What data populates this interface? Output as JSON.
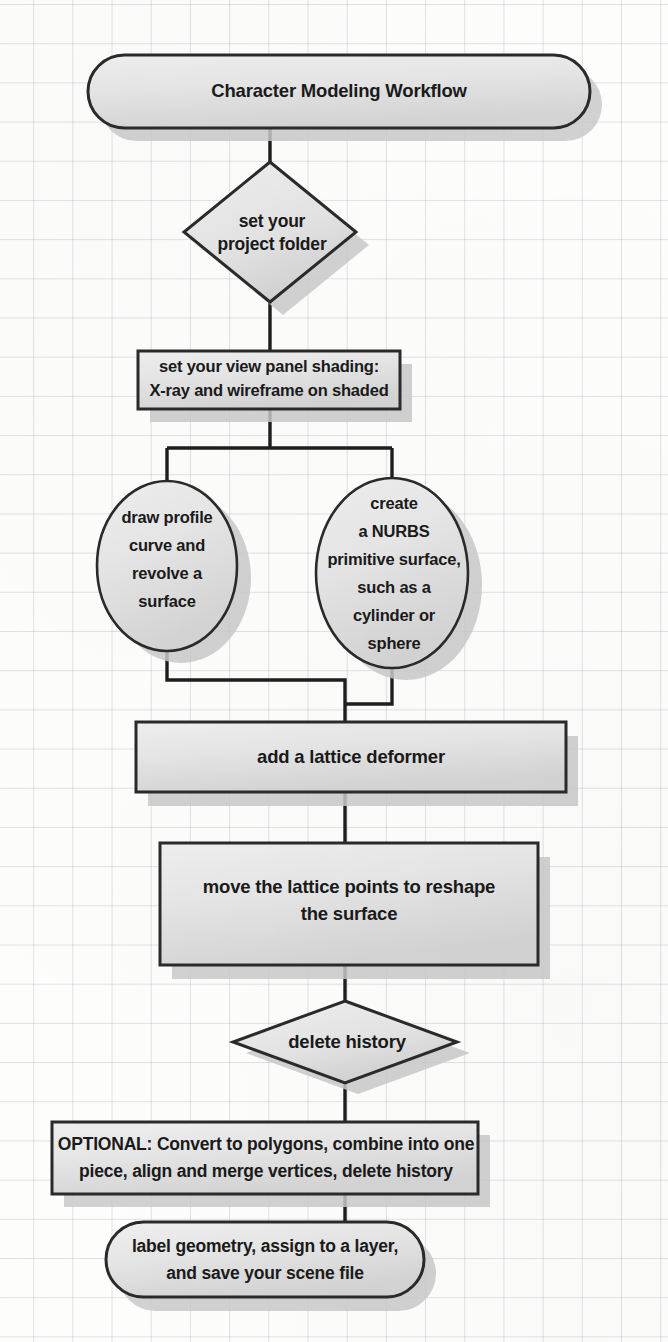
{
  "diagram": {
    "type": "flowchart",
    "title": "Character Modeling Workflow",
    "background": "#fdfdfc",
    "grid_color": "#96a0af",
    "shape_fill_light": "#ececec",
    "shape_fill_dark": "#d6d6d6",
    "shape_stroke": "#2a2a2a",
    "shadow_color": "#c9c9c9",
    "connector_color": "#1e1e1e",
    "nodes": [
      {
        "id": "title",
        "shape": "stadium",
        "label": "Character Modeling Workflow",
        "lines": [
          "Character Modeling Workflow"
        ]
      },
      {
        "id": "set-project-folder",
        "shape": "diamond",
        "label": "set your project folder",
        "lines": [
          "set your",
          "project folder"
        ]
      },
      {
        "id": "view-panel-shading",
        "shape": "rectangle",
        "label": "set your view panel shading: X-ray and wireframe on shaded",
        "lines": [
          "set your view panel shading:",
          "X-ray and wireframe on shaded"
        ]
      },
      {
        "id": "draw-profile-curve",
        "shape": "circle",
        "label": "draw profile curve and revolve a surface",
        "lines": [
          "draw profile",
          "curve and",
          "revolve a",
          "surface"
        ]
      },
      {
        "id": "create-nurbs-primitive",
        "shape": "circle",
        "label": "create a NURBS primitive surface, such as a cylinder or sphere",
        "lines": [
          "create",
          "a NURBS",
          "primitive surface,",
          "such as a",
          "cylinder or",
          "sphere"
        ]
      },
      {
        "id": "add-lattice-deformer",
        "shape": "rectangle",
        "label": "add a lattice deformer",
        "lines": [
          "add a lattice deformer"
        ]
      },
      {
        "id": "move-lattice-points",
        "shape": "rectangle",
        "label": "move the lattice points to reshape the surface",
        "lines": [
          "move the lattice points to reshape",
          "the surface"
        ]
      },
      {
        "id": "delete-history",
        "shape": "diamond",
        "label": "delete history",
        "lines": [
          "delete history"
        ]
      },
      {
        "id": "optional-convert-polygons",
        "shape": "rectangle",
        "label": "OPTIONAL: Convert to polygons, combine into one piece, align and merge vertices, delete history",
        "lines": [
          "OPTIONAL: Convert to polygons, combine into one",
          "piece, align and merge vertices, delete history"
        ]
      },
      {
        "id": "label-geometry-save",
        "shape": "stadium",
        "label": "label geometry, assign to a layer, and save your scene file",
        "lines": [
          "label geometry, assign to a layer,",
          "and save your scene file"
        ]
      }
    ],
    "edges": [
      {
        "from": "title",
        "to": "set-project-folder"
      },
      {
        "from": "set-project-folder",
        "to": "view-panel-shading"
      },
      {
        "from": "view-panel-shading",
        "to": "draw-profile-curve"
      },
      {
        "from": "view-panel-shading",
        "to": "create-nurbs-primitive"
      },
      {
        "from": "draw-profile-curve",
        "to": "add-lattice-deformer"
      },
      {
        "from": "create-nurbs-primitive",
        "to": "add-lattice-deformer"
      },
      {
        "from": "add-lattice-deformer",
        "to": "move-lattice-points"
      },
      {
        "from": "move-lattice-points",
        "to": "delete-history"
      },
      {
        "from": "delete-history",
        "to": "optional-convert-polygons"
      },
      {
        "from": "optional-convert-polygons",
        "to": "label-geometry-save"
      }
    ]
  }
}
